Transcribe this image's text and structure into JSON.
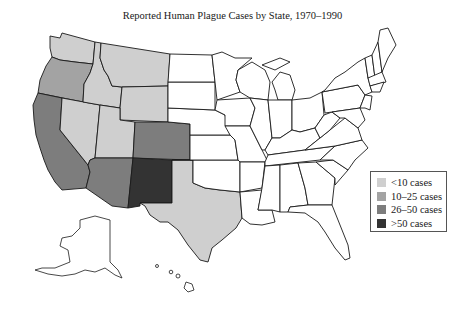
{
  "title": "Reported Human Plague Cases by State, 1970–1990",
  "legend": {
    "items": [
      {
        "label": "<10 cases",
        "color": "#cfcfcf"
      },
      {
        "label": "10–25 cases",
        "color": "#a3a3a3"
      },
      {
        "label": "26–50 cases",
        "color": "#7d7d7d"
      },
      {
        "label": ">50 cases",
        "color": "#333333"
      }
    ]
  },
  "colors": {
    "none": "#ffffff",
    "lt10": "#cfcfcf",
    "c10_25": "#a3a3a3",
    "c26_50": "#7d7d7d",
    "gt50": "#333333"
  },
  "states": {
    "lt10": [
      "Washington",
      "Montana",
      "Idaho",
      "Wyoming",
      "Nevada",
      "Utah",
      "Texas"
    ],
    "c10_25": [
      "Oregon"
    ],
    "c26_50": [
      "California",
      "Arizona",
      "Colorado"
    ],
    "gt50": [
      "New Mexico"
    ]
  }
}
